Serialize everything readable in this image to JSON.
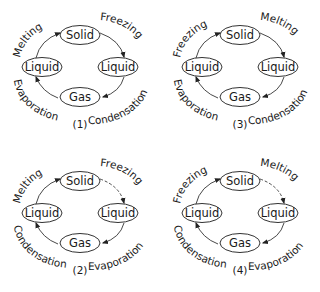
{
  "diagram": {
    "panels": [
      {
        "id": "1",
        "number_label": "(1)",
        "nodes": {
          "top": "Solid",
          "left": "Liquid",
          "right": "Liquid",
          "bottom": "Gas"
        },
        "processes": {
          "top_left": "Melting",
          "top_right": "Freezing",
          "bottom_left": "Evaporation",
          "bottom_right": "Condensation"
        },
        "dashed_top_right_arrow": false
      },
      {
        "id": "3",
        "number_label": "(3)",
        "nodes": {
          "top": "Solid",
          "left": "Liquid",
          "right": "Liquid",
          "bottom": "Gas"
        },
        "processes": {
          "top_left": "Freezing",
          "top_right": "Melting",
          "bottom_left": "Evaporation",
          "bottom_right": "Condensation"
        },
        "dashed_top_right_arrow": false
      },
      {
        "id": "2",
        "number_label": "(2)",
        "nodes": {
          "top": "Solid",
          "left": "Liquid",
          "right": "Liquid",
          "bottom": "Gas"
        },
        "processes": {
          "top_left": "Melting",
          "top_right": "Freezing",
          "bottom_left": "Condensation",
          "bottom_right": "Evaporation"
        },
        "dashed_top_right_arrow": true
      },
      {
        "id": "4",
        "number_label": "(4)",
        "nodes": {
          "top": "Solid",
          "left": "Liquid",
          "right": "Liquid",
          "bottom": "Gas"
        },
        "processes": {
          "top_left": "Freezing",
          "top_right": "Melting",
          "bottom_left": "Condensation",
          "bottom_right": "Evaporation"
        },
        "dashed_top_right_arrow": true
      }
    ]
  }
}
